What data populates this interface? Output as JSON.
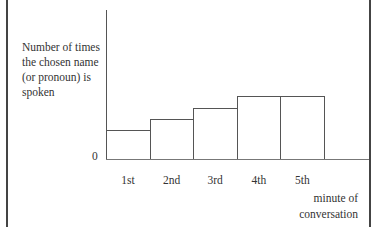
{
  "chart_data": {
    "type": "bar",
    "title": "",
    "ylabel": "Number of times the chosen name (or pronoun) is spoken",
    "xlabel": "minute of conversation",
    "categories": [
      "1st",
      "2nd",
      "3rd",
      "4th",
      "5th"
    ],
    "values": [
      29,
      40,
      51,
      63,
      63
    ],
    "y_tick_labels": [
      "0"
    ],
    "ylim": [
      0,
      149
    ],
    "grid": false,
    "legend": null,
    "note": "Values are relative bar heights (no numeric scale shown besides 0)"
  },
  "labels": {
    "y_axis_lines": [
      "Number of times",
      "the chosen name",
      "(or pronoun) is",
      "spoken"
    ],
    "zero": "0",
    "x_axis_lines": [
      "minute of",
      "conversation"
    ]
  }
}
